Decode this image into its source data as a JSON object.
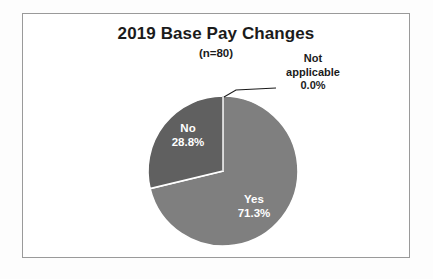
{
  "chart_data": {
    "type": "pie",
    "title": "2019 Base Pay Changes",
    "subtitle": "(n=80)",
    "sample_size": 80,
    "categories": [
      "Yes",
      "No",
      "Not applicable"
    ],
    "values": [
      71.3,
      28.8,
      0.0
    ],
    "value_suffix": "%",
    "labels": [
      "71.3%",
      "28.8%",
      "0.0%"
    ],
    "colors": [
      "#7f7f7f",
      "#606060",
      "#bfbfbf"
    ],
    "legend": "none",
    "grid": false,
    "start_angle_deg": 0,
    "direction": "clockwise",
    "slice_border_color": "#ffffff",
    "frame_color": "#9a9a9a",
    "background": "#ffffff",
    "label_text_color_inside": "#ffffff",
    "label_text_color_outside": "#1b1b1b"
  },
  "chart": {
    "title": "2019 Base Pay Changes",
    "subtitle": "(n=80)",
    "slices": [
      {
        "name": "Yes",
        "label": "Yes",
        "percent": "71.3%",
        "value": 71.3,
        "color": "#7f7f7f",
        "placement": "inside"
      },
      {
        "name": "No",
        "label": "No",
        "percent": "28.8%",
        "value": 28.8,
        "color": "#606060",
        "placement": "inside"
      },
      {
        "name": "Not applicable",
        "label_line1": "Not",
        "label_line2": "applicable",
        "percent": "0.0%",
        "value": 0.0,
        "color": "#bfbfbf",
        "placement": "callout"
      }
    ]
  }
}
